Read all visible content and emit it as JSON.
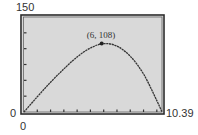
{
  "chart_data": {
    "type": "line",
    "title": "",
    "xlabel": "",
    "ylabel": "",
    "xlim": [
      0,
      10.39
    ],
    "ylim": [
      0,
      150
    ],
    "grid": false,
    "x_tick_step": 1,
    "y_tick_step": 25,
    "tick_labels": {
      "y_max": "150",
      "y_min": "0",
      "x_min": "0",
      "x_max": "10.39"
    },
    "series": [
      {
        "name": "curve",
        "color": "#333333",
        "x": [
          0,
          1,
          2,
          3,
          4,
          5,
          6,
          7,
          8,
          9,
          10,
          10.39
        ],
        "y": [
          0,
          24,
          47,
          68,
          87,
          101,
          108,
          104,
          88,
          60,
          18,
          0
        ]
      }
    ],
    "annotations": [
      {
        "text": "(6, 108)",
        "x": 6,
        "y": 108,
        "marker": "point"
      }
    ],
    "colors": {
      "plot_background": "#d9d9d9",
      "frame": "#2b2b2b",
      "curve": "#333333"
    }
  }
}
